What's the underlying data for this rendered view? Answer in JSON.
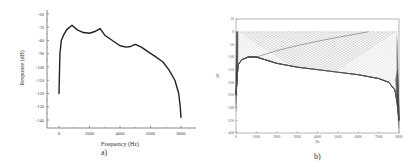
{
  "chart_data": [
    {
      "id": "a",
      "type": "line",
      "caption": "a)",
      "title": "",
      "xlabel": "Frequency (Hz)",
      "ylabel": "Response (dB)",
      "xlim": [
        0,
        8000
      ],
      "ylim": [
        -140,
        -60
      ],
      "xticks": [
        0,
        2000,
        4000,
        6000,
        8000
      ],
      "yticks": [
        -60,
        -70,
        -80,
        -90,
        -100,
        -110,
        -120,
        -130,
        -140
      ],
      "grid": false,
      "legend": null,
      "series": [
        {
          "name": "response",
          "color": "#222222",
          "x": [
            0,
            60,
            150,
            300,
            500,
            850,
            1200,
            1600,
            2000,
            2400,
            2700,
            3000,
            3500,
            4000,
            4400,
            4700,
            5000,
            5400,
            5900,
            6300,
            6800,
            7200,
            7600,
            7850,
            7950,
            8000
          ],
          "y": [
            -120,
            -90,
            -80,
            -76,
            -72,
            -68.5,
            -72,
            -74,
            -74.5,
            -73,
            -71,
            -76,
            -80,
            -84,
            -85,
            -84.5,
            -83,
            -85,
            -89,
            -92,
            -96,
            -102,
            -110,
            -120,
            -130,
            -138
          ]
        }
      ]
    },
    {
      "id": "b",
      "type": "line",
      "caption": "b)",
      "title": "",
      "xlabel": "Hz",
      "ylabel": "dB",
      "xlim": [
        0,
        8000
      ],
      "ylim": [
        -400,
        50
      ],
      "xticks": [
        0,
        1000,
        2000,
        3000,
        4000,
        5000,
        6000,
        7000,
        8000
      ],
      "yticks": [
        50,
        0,
        -50,
        -100,
        -150,
        -200,
        -250,
        -300,
        -350,
        -400
      ],
      "grid": false,
      "legend": null,
      "description": "Dense family of many overlapping thin gray response curves (filter bank); curves fan between 0 dB and a lower envelope that drops from ~-100 dB near 1000 Hz to ~-200 dB near 7800 Hz, with steep fall-off at both band edges",
      "series": [
        {
          "name": "lower-envelope",
          "color": "#333333",
          "x": [
            0,
            100,
            300,
            600,
            1000,
            2000,
            3000,
            4000,
            5000,
            6000,
            7000,
            7500,
            7800,
            7950,
            8000
          ],
          "y": [
            -250,
            -130,
            -110,
            -100,
            -100,
            -125,
            -140,
            -150,
            -160,
            -170,
            -185,
            -200,
            -230,
            -300,
            -350
          ]
        },
        {
          "name": "crossing-curve",
          "color": "#555555",
          "x": [
            1000,
            2000,
            3000,
            4000,
            5000,
            6000,
            6500
          ],
          "y": [
            -100,
            -75,
            -55,
            -38,
            -22,
            -8,
            0
          ]
        }
      ]
    }
  ]
}
